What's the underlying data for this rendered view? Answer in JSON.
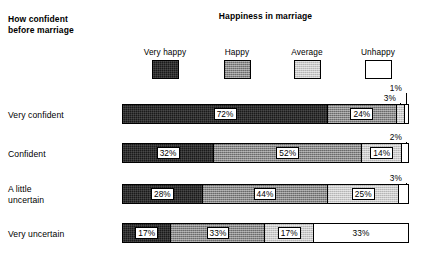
{
  "headers": {
    "row_group_title": "How confident\nbefore marriage",
    "chart_title": "Happiness in marriage"
  },
  "legend": {
    "items": [
      {
        "label": "Very happy",
        "swatch": "swatch-very-happy",
        "color": "#1a1a1a"
      },
      {
        "label": "Happy",
        "swatch": "swatch-happy",
        "color": "#888888"
      },
      {
        "label": "Average",
        "swatch": "swatch-average",
        "color": "#c9c9c9"
      },
      {
        "label": "Unhappy",
        "swatch": "swatch-unhappy",
        "color": "#ffffff"
      }
    ]
  },
  "rows": [
    {
      "label": "Very confident",
      "segments": [
        {
          "category": "Very happy",
          "value": 72,
          "value_label": "72%",
          "inline": true
        },
        {
          "category": "Happy",
          "value": 24,
          "value_label": "24%",
          "inline": true
        },
        {
          "category": "Average",
          "value": 3,
          "value_label": "3%",
          "inline": false
        },
        {
          "category": "Unhappy",
          "value": 1,
          "value_label": "1%",
          "inline": false
        }
      ],
      "callouts": [
        {
          "value_label": "1%",
          "category": "Unhappy"
        },
        {
          "value_label": "3%",
          "category": "Average"
        }
      ]
    },
    {
      "label": "Confident",
      "segments": [
        {
          "category": "Very happy",
          "value": 32,
          "value_label": "32%",
          "inline": true
        },
        {
          "category": "Happy",
          "value": 52,
          "value_label": "52%",
          "inline": true
        },
        {
          "category": "Average",
          "value": 14,
          "value_label": "14%",
          "inline": true
        },
        {
          "category": "Unhappy",
          "value": 2,
          "value_label": "2%",
          "inline": false
        }
      ],
      "callouts": [
        {
          "value_label": "2%",
          "category": "Unhappy"
        }
      ]
    },
    {
      "label": "A little\nuncertain",
      "segments": [
        {
          "category": "Very happy",
          "value": 28,
          "value_label": "28%",
          "inline": true
        },
        {
          "category": "Happy",
          "value": 44,
          "value_label": "44%",
          "inline": true
        },
        {
          "category": "Average",
          "value": 25,
          "value_label": "25%",
          "inline": true
        },
        {
          "category": "Unhappy",
          "value": 3,
          "value_label": "3%",
          "inline": false
        }
      ],
      "callouts": [
        {
          "value_label": "3%",
          "category": "Unhappy"
        }
      ]
    },
    {
      "label": "Very uncertain",
      "segments": [
        {
          "category": "Very happy",
          "value": 17,
          "value_label": "17%",
          "inline": true
        },
        {
          "category": "Happy",
          "value": 33,
          "value_label": "33%",
          "inline": true
        },
        {
          "category": "Average",
          "value": 17,
          "value_label": "17%",
          "inline": true
        },
        {
          "category": "Unhappy",
          "value": 33,
          "value_label": "33%",
          "inline": true,
          "plain": true
        }
      ],
      "callouts": []
    }
  ],
  "chart_data": {
    "type": "bar",
    "orientation": "horizontal",
    "stacked": true,
    "stack_total": 100,
    "units": "percent",
    "title": "Happiness in marriage",
    "xlabel": "",
    "ylabel": "How confident before marriage",
    "xlim": [
      0,
      100
    ],
    "grid": false,
    "legend_position": "top",
    "categories": [
      "Very confident",
      "Confident",
      "A little uncertain",
      "Very uncertain"
    ],
    "series": [
      {
        "name": "Very happy",
        "color": "#1a1a1a",
        "values": [
          72,
          32,
          28,
          17
        ]
      },
      {
        "name": "Happy",
        "color": "#888888",
        "values": [
          24,
          52,
          44,
          33
        ]
      },
      {
        "name": "Average",
        "color": "#c9c9c9",
        "values": [
          3,
          14,
          25,
          17
        ]
      },
      {
        "name": "Unhappy",
        "color": "#ffffff",
        "values": [
          1,
          2,
          3,
          33
        ]
      }
    ],
    "annotations": [
      {
        "row": "Very confident",
        "series": "Unhappy",
        "text": "1%",
        "style": "leader-line"
      },
      {
        "row": "Very confident",
        "series": "Average",
        "text": "3%",
        "style": "leader-line"
      },
      {
        "row": "Confident",
        "series": "Unhappy",
        "text": "2%",
        "style": "leader-line"
      },
      {
        "row": "A little uncertain",
        "series": "Unhappy",
        "text": "3%",
        "style": "leader-line"
      }
    ]
  },
  "layout": {
    "bar_left": 122,
    "bar_width": 287,
    "bar_height": 20,
    "row_tops": [
      104,
      143,
      184,
      223
    ],
    "label_tops": [
      110,
      149,
      184,
      229
    ],
    "legend_item_lefts": [
      8,
      80,
      150,
      221
    ]
  }
}
